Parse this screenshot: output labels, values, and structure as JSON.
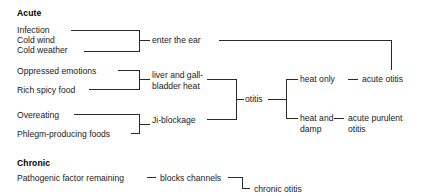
{
  "diagram": {
    "type": "flow-tree",
    "title_visible": false,
    "sections": [
      {
        "id": "acute",
        "heading": "Acute",
        "heading_pos": {
          "x": 17,
          "y": 8
        },
        "causes": [
          {
            "id": "infection",
            "label": "Infection",
            "x": 17,
            "y": 25
          },
          {
            "id": "cold-wind",
            "label": "Cold wind",
            "x": 17,
            "y": 35
          },
          {
            "id": "cold-weather",
            "label": "Cold weather",
            "x": 17,
            "y": 45
          },
          {
            "id": "oppressed-emotions",
            "label": "Oppressed emotions",
            "x": 17,
            "y": 66
          },
          {
            "id": "rich-spicy-food",
            "label": "Rich spicy food",
            "x": 17,
            "y": 85
          },
          {
            "id": "overeating",
            "label": "Overeating",
            "x": 17,
            "y": 110
          },
          {
            "id": "phlegm-producing-foods",
            "label": "Phlegm-producing foods",
            "x": 17,
            "y": 130
          }
        ],
        "mechanisms": [
          {
            "id": "enter-the-ear",
            "label": "enter the ear",
            "x": 152,
            "y": 35
          },
          {
            "id": "liver-gallbladder-heat",
            "line1": "liver and gall-",
            "line2": "bladder heat",
            "x": 152,
            "y": 71
          },
          {
            "id": "ji-blockage",
            "label": "Ji-blockage",
            "x": 152,
            "y": 115
          },
          {
            "id": "otitis",
            "label": "otitis",
            "x": 245,
            "y": 94
          }
        ],
        "patterns": [
          {
            "id": "heat-only",
            "label": "heat only",
            "x": 300,
            "y": 74
          },
          {
            "id": "heat-and-damp-l1",
            "label": "heat and",
            "x": 300,
            "y": 113
          },
          {
            "id": "heat-and-damp-l2",
            "label": "damp",
            "x": 300,
            "y": 127
          }
        ],
        "outcomes": [
          {
            "id": "acute-otitis",
            "label": "acute otitis",
            "x": 362,
            "y": 74
          },
          {
            "id": "acute-purulent-otitis-l1",
            "label": "acute purulent",
            "x": 348,
            "y": 113
          },
          {
            "id": "acute-purulent-otitis-l2",
            "label": "otitis",
            "x": 348,
            "y": 127
          }
        ],
        "dashes": [
          {
            "id": "dash-enter-ear",
            "x": 142,
            "y": 39
          },
          {
            "id": "dash-liver-heat",
            "x": 142,
            "y": 75
          },
          {
            "id": "dash-ji-blockage",
            "x": 142,
            "y": 119
          },
          {
            "id": "dash-heat-only-out",
            "x": 346,
            "y": 78
          },
          {
            "id": "dash-heat-damp-out",
            "x": 333,
            "y": 117
          }
        ]
      },
      {
        "id": "chronic",
        "heading": "Chronic",
        "heading_pos": {
          "x": 17,
          "y": 158
        },
        "causes": [
          {
            "id": "pathogenic-factor-remaining",
            "label": "Pathogenic factor remaining",
            "x": 17,
            "y": 173
          }
        ],
        "mechanisms": [
          {
            "id": "blocks-channels",
            "label": "blocks channels",
            "x": 158,
            "y": 173
          }
        ],
        "outcomes": [
          {
            "id": "chronic-otitis",
            "label": "chronic otitis",
            "x": 254,
            "y": 185
          }
        ],
        "dashes": [
          {
            "id": "dash-pathogenic",
            "x": 145,
            "y": 177
          },
          {
            "id": "dash-chronic-otitis",
            "x": 246,
            "y": 189
          }
        ]
      }
    ],
    "colors": {
      "line": "#2a2a2a",
      "text": "#1a1a1a",
      "heading": "#000000",
      "background": "#ffffff"
    },
    "connectors": {
      "bracket_acute_entry": {
        "x": 140,
        "top": 30,
        "bottom": 52,
        "stub_y": 40
      },
      "bracket_liver": {
        "x": 140,
        "top": 70,
        "bottom": 89,
        "stub_y": 79
      },
      "bracket_ji": {
        "x": 140,
        "top": 114,
        "bottom": 134,
        "stub_y": 124
      },
      "bracket_otitis": {
        "x": 237,
        "top": 79,
        "bottom": 119,
        "stub_y": 99
      },
      "bracket_patterns": {
        "x": 286,
        "top": 78,
        "bottom": 118,
        "stub_y": 98
      },
      "enter_ear_long": {
        "y": 40,
        "x_start": 222,
        "x_end": 392,
        "drop_to": 78
      },
      "chronic_corner": {
        "x": 243,
        "y_top": 177,
        "y_bottom": 189
      }
    }
  }
}
